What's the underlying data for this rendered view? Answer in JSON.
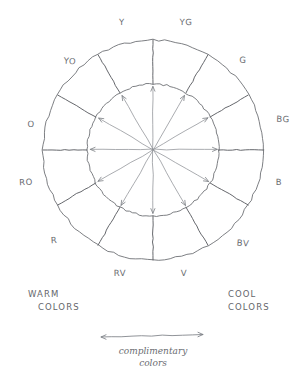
{
  "diagram": {
    "center": {
      "x": 153,
      "y": 150
    },
    "outer_radius": 110,
    "inner_radius": 66,
    "segment_count": 12,
    "ink_color": "#6a6c71",
    "paper_color": "#ffffff"
  },
  "hues": [
    {
      "code": "Y",
      "angle_deg": 90,
      "label_x": 122,
      "label_y": 22
    },
    {
      "code": "YG",
      "angle_deg": 60,
      "label_x": 186,
      "label_y": 22
    },
    {
      "code": "G",
      "angle_deg": 30,
      "label_x": 243,
      "label_y": 60
    },
    {
      "code": "BG",
      "angle_deg": 0,
      "label_x": 283,
      "label_y": 119
    },
    {
      "code": "B",
      "angle_deg": 330,
      "label_x": 279,
      "label_y": 182
    },
    {
      "code": "BV",
      "angle_deg": 300,
      "label_x": 243,
      "label_y": 243
    },
    {
      "code": "V",
      "angle_deg": 270,
      "label_x": 184,
      "label_y": 273
    },
    {
      "code": "RV",
      "angle_deg": 240,
      "label_x": 120,
      "label_y": 273
    },
    {
      "code": "R",
      "angle_deg": 210,
      "label_x": 54,
      "label_y": 240
    },
    {
      "code": "RO",
      "angle_deg": 180,
      "label_x": 26,
      "label_y": 182
    },
    {
      "code": "O",
      "angle_deg": 150,
      "label_x": 31,
      "label_y": 124
    },
    {
      "code": "YO",
      "angle_deg": 120,
      "label_x": 70,
      "label_y": 61
    }
  ],
  "annotations": {
    "warm": {
      "line1": "WARM",
      "line2": "COLORS",
      "x": 28,
      "y": 288
    },
    "cool": {
      "line1": "COOL",
      "line2": "COLORS",
      "x": 228,
      "y": 288
    },
    "complimentary": {
      "line1": "complimentary",
      "line2": "colors",
      "x": 153,
      "y": 345,
      "arrow_left_x": 101,
      "arrow_right_x": 203,
      "arrow_y": 337
    }
  }
}
